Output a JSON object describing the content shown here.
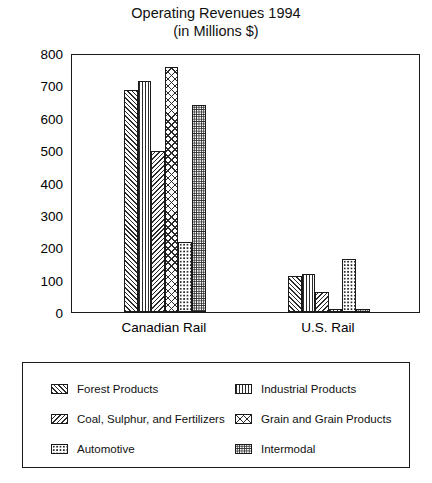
{
  "chart_data": {
    "type": "bar",
    "title": "Operating Revenues 1994",
    "subtitle": "(in Millions $)",
    "xlabel": "",
    "ylabel": "",
    "ylim": [
      0,
      800
    ],
    "yticks": [
      0,
      100,
      200,
      300,
      400,
      500,
      600,
      700,
      800
    ],
    "ytick_labels": [
      "0",
      "100",
      "200",
      "300",
      "400",
      "500",
      "600",
      "700",
      "800"
    ],
    "grid": false,
    "legend_position": "bottom",
    "categories": [
      "Canadian Rail",
      "U.S. Rail"
    ],
    "series": [
      {
        "name": "Forest Products",
        "pattern": "forward-diagonal-hatch",
        "values": [
          685,
          110
        ]
      },
      {
        "name": "Industrial Products",
        "pattern": "vertical-lines",
        "values": [
          715,
          118
        ]
      },
      {
        "name": "Coal, Sulphur, and Fertilizers",
        "pattern": "backward-diagonal-hatch",
        "values": [
          497,
          62
        ]
      },
      {
        "name": "Grain and Grain Products",
        "pattern": "cross-hatch",
        "values": [
          757,
          10
        ]
      },
      {
        "name": "Automotive",
        "pattern": "light-dots",
        "values": [
          215,
          163
        ]
      },
      {
        "name": "Intermodal",
        "pattern": "dense-dots",
        "values": [
          640,
          10
        ]
      }
    ]
  },
  "legend": {
    "entries": [
      {
        "label": "Forest Products"
      },
      {
        "label": "Industrial Products"
      },
      {
        "label": "Coal, Sulphur, and Fertilizers"
      },
      {
        "label": "Grain and Grain Products"
      },
      {
        "label": "Automotive"
      },
      {
        "label": "Intermodal"
      }
    ]
  }
}
